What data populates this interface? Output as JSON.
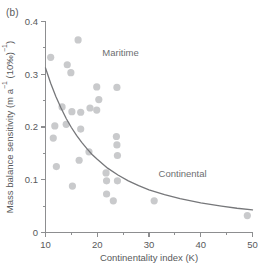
{
  "figure": {
    "panel_label": "(b)",
    "background_color": "#ffffff",
    "point_color": "#c9cacc",
    "curve_color": "#76777a",
    "axis_color": "#8d8e90",
    "text_color": "#58595b"
  },
  "chart_data": {
    "type": "scatter",
    "title": "",
    "xlabel": "Continentality index (K)",
    "ylabel": "Mass balance sensitivity (m a−1 (10‰)−1)",
    "ylabel_plain": "Mass balance sensitivity (m a-1 (10 permille)-1)",
    "xlim": [
      10,
      50
    ],
    "ylim": [
      0,
      0.4
    ],
    "xticks": [
      10,
      20,
      30,
      40,
      50
    ],
    "xtick_labels": [
      "10",
      "20",
      "30",
      "40",
      "50"
    ],
    "xticks_minor": [
      15,
      25,
      35,
      45
    ],
    "yticks": [
      0,
      0.1,
      0.2,
      0.3,
      0.4
    ],
    "ytick_labels": [
      "0",
      "0.1",
      "0.2",
      "0.3",
      "0.4"
    ],
    "yticks_minor": [
      0.05,
      0.15,
      0.25,
      0.35
    ],
    "grid": false,
    "legend_position": "none",
    "annotations": [
      {
        "text": "Maritime",
        "x": 24.5,
        "y": 0.335
      },
      {
        "text": "Continental",
        "y": 0.105,
        "x": 36.5
      }
    ],
    "series": [
      {
        "name": "Glacier observations",
        "type": "scatter",
        "marker": "circle",
        "color": "#c9cacc",
        "points": [
          {
            "x": 11.0,
            "y": 0.332
          },
          {
            "x": 16.3,
            "y": 0.365
          },
          {
            "x": 14.2,
            "y": 0.318
          },
          {
            "x": 14.9,
            "y": 0.303
          },
          {
            "x": 19.9,
            "y": 0.276
          },
          {
            "x": 23.8,
            "y": 0.275
          },
          {
            "x": 20.3,
            "y": 0.252
          },
          {
            "x": 13.2,
            "y": 0.238
          },
          {
            "x": 18.6,
            "y": 0.236
          },
          {
            "x": 19.9,
            "y": 0.232
          },
          {
            "x": 15.1,
            "y": 0.229
          },
          {
            "x": 16.8,
            "y": 0.228
          },
          {
            "x": 11.8,
            "y": 0.202
          },
          {
            "x": 14.0,
            "y": 0.205
          },
          {
            "x": 16.8,
            "y": 0.196
          },
          {
            "x": 11.5,
            "y": 0.179
          },
          {
            "x": 23.7,
            "y": 0.182
          },
          {
            "x": 23.8,
            "y": 0.166
          },
          {
            "x": 18.4,
            "y": 0.153
          },
          {
            "x": 23.9,
            "y": 0.146
          },
          {
            "x": 16.5,
            "y": 0.137
          },
          {
            "x": 12.1,
            "y": 0.125
          },
          {
            "x": 21.7,
            "y": 0.113
          },
          {
            "x": 21.8,
            "y": 0.098
          },
          {
            "x": 23.9,
            "y": 0.098
          },
          {
            "x": 15.2,
            "y": 0.088
          },
          {
            "x": 21.8,
            "y": 0.073
          },
          {
            "x": 23.1,
            "y": 0.06
          },
          {
            "x": 31.0,
            "y": 0.06
          },
          {
            "x": 49.0,
            "y": 0.032
          }
        ]
      },
      {
        "name": "Fitted decay curve",
        "type": "line",
        "color": "#76777a",
        "points": [
          {
            "x": 10.0,
            "y": 0.312
          },
          {
            "x": 11.0,
            "y": 0.283
          },
          {
            "x": 12.0,
            "y": 0.258
          },
          {
            "x": 13.0,
            "y": 0.236
          },
          {
            "x": 14.0,
            "y": 0.216
          },
          {
            "x": 15.0,
            "y": 0.199
          },
          {
            "x": 16.0,
            "y": 0.184
          },
          {
            "x": 17.0,
            "y": 0.171
          },
          {
            "x": 18.0,
            "y": 0.159
          },
          {
            "x": 19.0,
            "y": 0.148
          },
          {
            "x": 20.0,
            "y": 0.139
          },
          {
            "x": 22.0,
            "y": 0.122
          },
          {
            "x": 24.0,
            "y": 0.109
          },
          {
            "x": 26.0,
            "y": 0.098
          },
          {
            "x": 28.0,
            "y": 0.089
          },
          {
            "x": 30.0,
            "y": 0.081
          },
          {
            "x": 33.0,
            "y": 0.072
          },
          {
            "x": 36.0,
            "y": 0.064
          },
          {
            "x": 40.0,
            "y": 0.056
          },
          {
            "x": 44.0,
            "y": 0.05
          },
          {
            "x": 47.0,
            "y": 0.046
          },
          {
            "x": 50.0,
            "y": 0.043
          }
        ]
      }
    ]
  }
}
